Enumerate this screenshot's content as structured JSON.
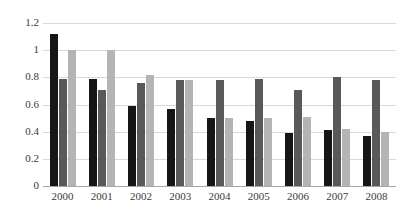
{
  "chart_data": {
    "type": "bar",
    "title": "",
    "subtitle": "",
    "xlabel": "",
    "ylabel": "",
    "categories": [
      "2000",
      "2001",
      "2002",
      "2003",
      "2004",
      "2005",
      "2006",
      "2007",
      "2008"
    ],
    "series": [
      {
        "name": "series-1",
        "color": "#161616",
        "values": [
          1.12,
          0.79,
          0.59,
          0.57,
          0.5,
          0.48,
          0.39,
          0.41,
          0.37
        ]
      },
      {
        "name": "series-2",
        "color": "#59595b",
        "values": [
          0.79,
          0.71,
          0.76,
          0.78,
          0.78,
          0.79,
          0.71,
          0.8,
          0.78
        ]
      },
      {
        "name": "series-3",
        "color": "#b4b4b4",
        "values": [
          1.0,
          1.0,
          0.82,
          0.78,
          0.5,
          0.5,
          0.51,
          0.42,
          0.4
        ]
      }
    ],
    "ylim": [
      0,
      1.2
    ],
    "yticks": [
      0,
      0.2,
      0.4,
      0.6,
      0.8,
      1,
      1.2
    ],
    "ytick_labels": [
      "0",
      "0.2",
      "0.4",
      "0.6",
      "0.8",
      "1",
      "1.2"
    ],
    "grid": true,
    "grid_color": "#d9d9d9",
    "axis_color": "#a6a6a6",
    "legend": false,
    "legend_position": "none",
    "background": "#ffffff",
    "annotations": []
  }
}
